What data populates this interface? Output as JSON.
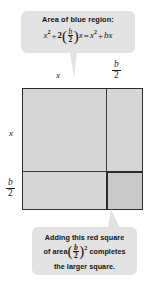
{
  "figure": {
    "background_color": "#ffffff",
    "callout_fill": "#e2e2e2",
    "blue_region_color": "#d6d6d6",
    "red_region_color": "#c9c9c9",
    "outline_color": "#2b2b2b"
  },
  "callout_top": {
    "headline": "Area of blue region:",
    "equation": {
      "lhs_term1_base": "x",
      "lhs_term1_exp": "2",
      "plus": "+",
      "coefficient": "2",
      "paren_open": "(",
      "fraction_num": "b",
      "fraction_den": "2",
      "paren_close": ")",
      "multiplier": "x",
      "equals": "=",
      "rhs_term1_base": "x",
      "rhs_term1_exp": "2",
      "rhs_plus": "+",
      "rhs_term2": "bx"
    },
    "equation_plain": "x² + 2(b/2)x = x² + bx"
  },
  "callout_bottom": {
    "line1": "Adding this red square",
    "line2_prefix": "of area",
    "line2_paren_open": "(",
    "line2_num": "b",
    "line2_den": "2",
    "line2_paren_close": ")",
    "line2_exp": "2",
    "line2_suffix": "completes",
    "line3": "the larger square.",
    "text_plain": "Adding this red square of area (b/2)² completes the larger square."
  },
  "dimensions": {
    "top_left_label": "x",
    "top_right_num": "b",
    "top_right_den": "2",
    "top_right_plain": "b/2",
    "left_upper_label": "x",
    "left_lower_num": "b",
    "left_lower_den": "2",
    "left_lower_plain": "b/2"
  }
}
